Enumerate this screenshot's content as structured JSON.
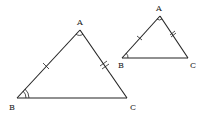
{
  "diagram": {
    "type": "similar-triangles",
    "triangles": [
      {
        "name": "large-triangle",
        "vertices": {
          "A": {
            "label": "A",
            "x": 80,
            "y": 30,
            "label_x": 77,
            "label_y": 25
          },
          "B": {
            "label": "B",
            "x": 17,
            "y": 98,
            "label_x": 9,
            "label_y": 110
          },
          "C": {
            "label": "C",
            "x": 127,
            "y": 98,
            "label_x": 130,
            "label_y": 110
          }
        },
        "tick_marks": {
          "AB": 1,
          "AC": 2
        },
        "angle_marks": {
          "A": 1,
          "B": 2
        }
      },
      {
        "name": "small-triangle",
        "vertices": {
          "A": {
            "label": "A",
            "x": 160,
            "y": 16,
            "label_x": 156,
            "label_y": 11
          },
          "B": {
            "label": "B",
            "x": 122,
            "y": 58,
            "label_x": 118,
            "label_y": 68
          },
          "C": {
            "label": "C",
            "x": 188,
            "y": 58,
            "label_x": 190,
            "label_y": 68
          }
        },
        "tick_marks": {
          "AB": 1,
          "AC": 2
        },
        "angle_marks": {
          "A": 1,
          "B": 1
        }
      }
    ],
    "labels": {
      "large_A": "A",
      "large_B": "B",
      "large_C": "C",
      "small_A": "A",
      "small_B": "B",
      "small_C": "C"
    },
    "colors": {
      "stroke": "#222222",
      "background": "#ffffff"
    }
  }
}
